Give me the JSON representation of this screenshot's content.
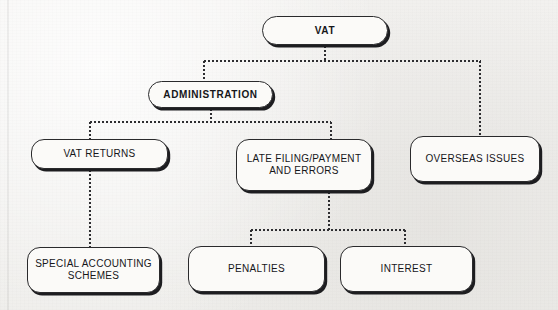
{
  "diagram": {
    "title": "VAT",
    "background_color": "#f1f0ee",
    "node_fill_color": "#fbfaf8",
    "node_border_color": "#2a2a2c",
    "connector_color": "#2d2d30",
    "nodes": [
      {
        "id": "vat",
        "label": "VAT",
        "level": 0,
        "shape": "pill",
        "bold": true,
        "x": 262,
        "y": 16,
        "w": 126,
        "h": 29
      },
      {
        "id": "admin",
        "label": "ADMINISTRATION",
        "level": 1,
        "shape": "pill",
        "bold": true,
        "x": 148,
        "y": 81,
        "w": 125,
        "h": 27
      },
      {
        "id": "overseas",
        "label": "OVERSEAS ISSUES",
        "level": 2,
        "shape": "rounded",
        "bold": false,
        "x": 410,
        "y": 136,
        "w": 130,
        "h": 46
      },
      {
        "id": "returns",
        "label": "VAT RETURNS",
        "level": 2,
        "shape": "rounded",
        "bold": false,
        "x": 31,
        "y": 139,
        "w": 137,
        "h": 30
      },
      {
        "id": "latefiling",
        "label": "LATE FILING/PAYMENT\nAND ERRORS",
        "level": 2,
        "shape": "rounded",
        "bold": false,
        "x": 236,
        "y": 139,
        "w": 136,
        "h": 52
      },
      {
        "id": "schemes",
        "label": "SPECIAL ACCOUNTING\nSCHEMES",
        "level": 3,
        "shape": "rounded",
        "bold": false,
        "x": 27,
        "y": 247,
        "w": 133,
        "h": 46
      },
      {
        "id": "penalties",
        "label": "PENALTIES",
        "level": 3,
        "shape": "rounded",
        "bold": false,
        "x": 188,
        "y": 246,
        "w": 137,
        "h": 46
      },
      {
        "id": "interest",
        "label": "INTEREST",
        "level": 3,
        "shape": "rounded",
        "bold": false,
        "x": 340,
        "y": 246,
        "w": 133,
        "h": 46
      }
    ],
    "edges": [
      {
        "from": "vat",
        "to": "admin",
        "style": "dotted"
      },
      {
        "from": "vat",
        "to": "overseas",
        "style": "dotted"
      },
      {
        "from": "admin",
        "to": "returns",
        "style": "dotted"
      },
      {
        "from": "admin",
        "to": "latefiling",
        "style": "dotted"
      },
      {
        "from": "returns",
        "to": "schemes",
        "style": "dotted"
      },
      {
        "from": "latefiling",
        "to": "penalties",
        "style": "dotted"
      },
      {
        "from": "latefiling",
        "to": "interest",
        "style": "dotted"
      }
    ]
  },
  "labels": {
    "vat": "VAT",
    "administration": "ADMINISTRATION",
    "vat_returns": "VAT RETURNS",
    "late_filing_line1": "LATE FILING/PAYMENT",
    "late_filing_line2": "AND ERRORS",
    "overseas_issues": "OVERSEAS ISSUES",
    "special_accounting_line1": "SPECIAL ACCOUNTING",
    "special_accounting_line2": "SCHEMES",
    "penalties": "PENALTIES",
    "interest": "INTEREST"
  }
}
